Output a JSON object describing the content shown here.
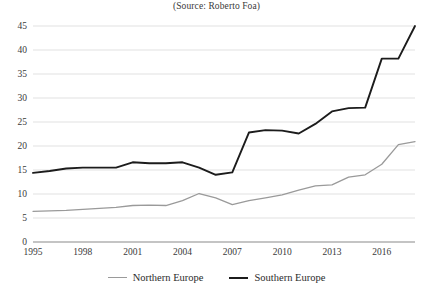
{
  "source_note": "(Source: Roberto Foa)",
  "legend": {
    "position": "bottom-center",
    "items": [
      {
        "label": "Northern Europe",
        "color": "#9a9a9a"
      },
      {
        "label": "Southern Europe",
        "color": "#1c1c1c"
      }
    ]
  },
  "axes": {
    "y_ticks": [
      "0",
      "5",
      "10",
      "15",
      "20",
      "25",
      "30",
      "35",
      "40",
      "45"
    ],
    "x_ticks": [
      "1995",
      "1998",
      "2001",
      "2004",
      "2007",
      "2010",
      "2013",
      "2016"
    ]
  },
  "chart_data": {
    "type": "line",
    "title": "",
    "subtitle": "(Source: Roberto Foa)",
    "xlabel": "",
    "ylabel": "",
    "xlim": [
      1995,
      2018
    ],
    "ylim": [
      0,
      45
    ],
    "grid": true,
    "legend_position": "bottom-center",
    "x": [
      1995,
      1996,
      1997,
      1998,
      1999,
      2000,
      2001,
      2002,
      2003,
      2004,
      2005,
      2006,
      2007,
      2008,
      2009,
      2010,
      2011,
      2012,
      2013,
      2014,
      2015,
      2016,
      2017,
      2018
    ],
    "x_tick_values": [
      1995,
      1998,
      2001,
      2004,
      2007,
      2010,
      2013,
      2016
    ],
    "y_tick_values": [
      0,
      5,
      10,
      15,
      20,
      25,
      30,
      35,
      40,
      45
    ],
    "series": [
      {
        "name": "Northern Europe",
        "color": "#9a9a9a",
        "width": 1.3,
        "values": [
          6.4,
          6.5,
          6.6,
          6.8,
          7.0,
          7.2,
          7.6,
          7.7,
          7.6,
          8.6,
          10.1,
          9.2,
          7.8,
          8.6,
          9.2,
          9.8,
          10.8,
          11.7,
          11.9,
          13.5,
          14.0,
          16.2,
          20.3,
          20.9
        ]
      },
      {
        "name": "Southern Europe",
        "color": "#1c1c1c",
        "width": 1.9,
        "values": [
          14.4,
          14.8,
          15.3,
          15.5,
          15.5,
          15.5,
          16.6,
          16.4,
          16.4,
          16.6,
          15.5,
          14.0,
          14.5,
          22.8,
          23.3,
          23.2,
          22.6,
          24.6,
          27.2,
          27.9,
          28.0,
          38.2,
          38.2,
          45.0
        ]
      }
    ]
  }
}
